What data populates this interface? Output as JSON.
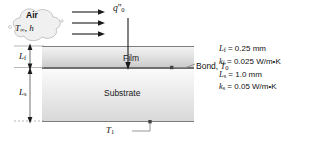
{
  "diagram": {
    "cloud": {
      "medium_label": "Air",
      "ambient_symbol": "T",
      "ambient_subscript": "∞",
      "separator": ", ",
      "coefficient_symbol": "h"
    },
    "flux": {
      "symbol": "q",
      "primes": "″",
      "subscript": "0"
    },
    "layers": [
      {
        "name": "Film",
        "thickness_symbol": "L",
        "thickness_subscript": "f"
      },
      {
        "name": "Substrate",
        "thickness_symbol": "L",
        "thickness_subscript": "s"
      }
    ],
    "bond": {
      "label": "Bond, ",
      "temperature_symbol": "T",
      "temperature_subscript": "0"
    },
    "base": {
      "temperature_symbol": "T",
      "temperature_subscript": "1"
    }
  },
  "parameters": [
    {
      "symbol": "L",
      "subscript": "f",
      "value": "= 0.25 mm"
    },
    {
      "symbol": "k",
      "subscript": "f",
      "value": "= 0.025 W/m•K"
    },
    {
      "symbol": "L",
      "subscript": "s",
      "value": "= 1.0 mm"
    },
    {
      "symbol": "k",
      "subscript": "s",
      "value": "= 0.05 W/m•K"
    }
  ],
  "colors": {
    "film_fill": "#e2e2e2",
    "substrate_fill": "#ededed",
    "line": "#7d7d7d",
    "bond_line": "#6e6e6e",
    "text": "#111111"
  }
}
